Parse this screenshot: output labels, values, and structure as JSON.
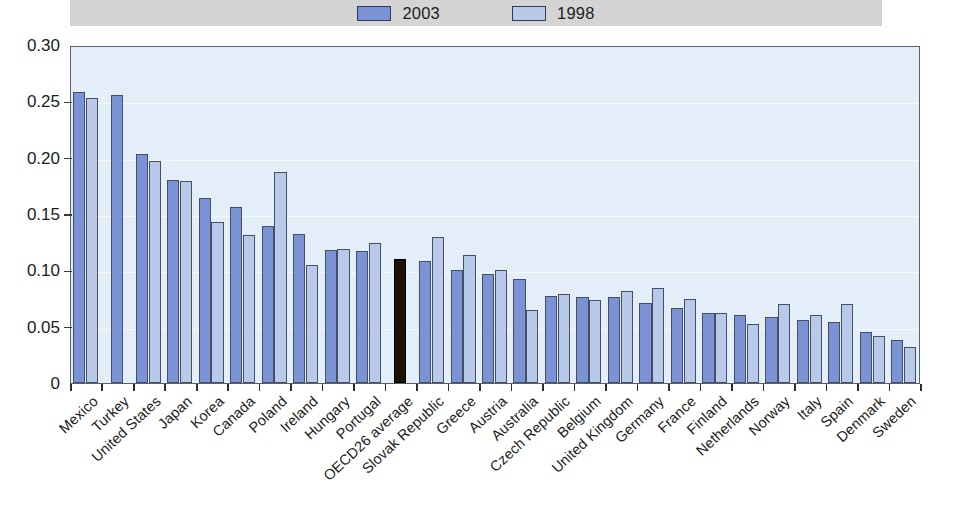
{
  "legend": {
    "entries": [
      {
        "label": "2003",
        "color": "#7b92d4",
        "name": "legend-2003"
      },
      {
        "label": "1998",
        "color": "#b9c9ea",
        "name": "legend-1998"
      }
    ]
  },
  "axis": {
    "y_ticks": [
      "0.30",
      "0.25",
      "0.20",
      "0.15",
      "0.10",
      "0.05",
      "0"
    ],
    "y_tick_values": [
      0.3,
      0.25,
      0.2,
      0.15,
      0.1,
      0.05,
      0
    ]
  },
  "chart_data": {
    "type": "bar",
    "title": "",
    "subtitle": "",
    "xlabel": "",
    "ylabel": "",
    "ylim": [
      0,
      0.3
    ],
    "ytick_step": 0.05,
    "grid": true,
    "legend_position": "top-center",
    "highlight_category": "OECD26 average",
    "highlight_color": "#1a1008",
    "categories": [
      "Mexico",
      "Turkey",
      "United States",
      "Japan",
      "Korea",
      "Canada",
      "Poland",
      "Ireland",
      "Hungary",
      "Portugal",
      "OECD26 average",
      "Slovak Republic",
      "Greece",
      "Austria",
      "Australia",
      "Czech Republic",
      "Belgium",
      "United Kingdom",
      "Germany",
      "France",
      "Finland",
      "Netherlands",
      "Norway",
      "Italy",
      "Spain",
      "Denmark",
      "Sweden"
    ],
    "series": [
      {
        "name": "2003",
        "color": "#7b92d4",
        "values": [
          0.258,
          0.256,
          0.203,
          0.18,
          0.164,
          0.156,
          0.139,
          0.132,
          0.118,
          0.117,
          0.11,
          0.108,
          0.1,
          0.097,
          0.092,
          0.077,
          0.076,
          0.076,
          0.071,
          0.067,
          0.062,
          0.06,
          0.059,
          0.056,
          0.054,
          0.045,
          0.038
        ]
      },
      {
        "name": "1998",
        "color": "#b9c9ea",
        "values": [
          0.253,
          null,
          0.197,
          0.179,
          0.143,
          0.131,
          0.187,
          0.105,
          0.119,
          0.124,
          null,
          0.13,
          0.114,
          0.1,
          0.065,
          0.079,
          0.074,
          0.082,
          0.084,
          0.075,
          0.062,
          0.052,
          0.07,
          0.06,
          0.07,
          0.042,
          0.032
        ]
      }
    ]
  }
}
